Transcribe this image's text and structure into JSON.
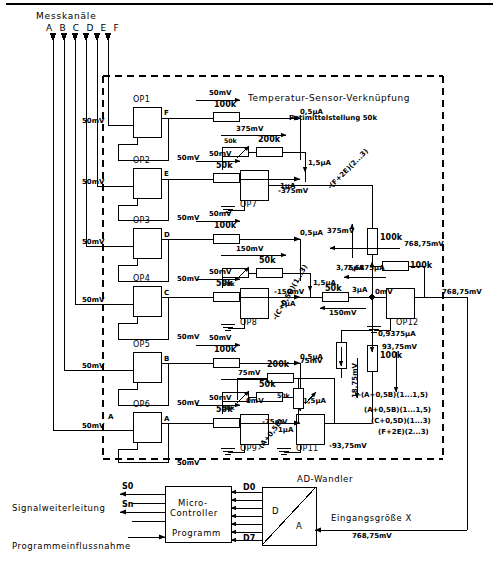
{
  "meta": {
    "width": 499,
    "height": 587,
    "ink": "#000000",
    "background": "#ffffff"
  },
  "inputs": {
    "header": "Messkanäle",
    "channels": "A B C D E F",
    "channel_list": [
      "A",
      "B",
      "C",
      "D",
      "E",
      "F"
    ],
    "input_voltage": "50mV"
  },
  "diagram_title": "Temperatur-Sensor-Verknüpfung",
  "pot_note": "Potimittelstellung 50k",
  "stages": [
    {
      "opamp": "OP1",
      "out_letter": "F",
      "fb": "50mV",
      "in": "50mV",
      "arrow_v": "50mV",
      "resistor": "100k",
      "current": "0,5µA"
    },
    {
      "opamp": "OP2",
      "out_letter": "E",
      "fb": "50mV",
      "in": "50mV",
      "arrow_v": "50mV",
      "resistor": "50k",
      "current": "1µA"
    },
    {
      "opamp": "OP3",
      "out_letter": "D",
      "fb": "50mV",
      "in": "50mV",
      "arrow_v": "50mV",
      "resistor": "100k",
      "current": "0,5µA"
    },
    {
      "opamp": "OP4",
      "out_letter": "C",
      "fb": "50mV",
      "in": "50mV",
      "arrow_v": "50mV",
      "resistor": "50k",
      "current": "1µA"
    },
    {
      "opamp": "OP5",
      "out_letter": "B",
      "fb": "50mV",
      "in": "50mV",
      "arrow_v": "50mV",
      "resistor": "100k",
      "current": "0,5µA"
    },
    {
      "opamp": "OP6",
      "out_letter": "A",
      "fb": "50mV",
      "in": "50mV",
      "arrow_v": "50mV",
      "resistor": "50k",
      "current": "1µA"
    }
  ],
  "summers": [
    {
      "opamp": "OP7",
      "pot": "50k",
      "series_r": "200k",
      "arrow_v": "375mV",
      "current": "1,5µA",
      "out_v": "-375mV",
      "formula": "-(F+2E)(2...3)"
    },
    {
      "opamp": "OP8",
      "pot": "50k",
      "series_r": "50k",
      "arrow_v": "150mV",
      "current": "1,5µA",
      "out_v": "-150mV",
      "formula": "-(C+0,5D)(1...3)"
    },
    {
      "opamp": "OP9",
      "pot": "50k",
      "series_r": "50k",
      "arrow_v": "75mV",
      "current": "1,5µA",
      "out_v": "-75mV",
      "formula": "-(A+0,5B)",
      "zero": "0mV"
    }
  ],
  "op11": {
    "opamp": "OP11",
    "in_v": "-75mV",
    "series_r": "200k",
    "pot": "50k",
    "top_v": "75mV",
    "rot_v": "18,75mV",
    "out_v": "-93,75mV",
    "right_v": "93,75mV",
    "r_100k": "100k",
    "current": "0,9375µA"
  },
  "op12": {
    "opamp": "OP12",
    "zero": "0mV",
    "feedback_r": "100k",
    "feedback_v": "768,75mV",
    "feedback_i": "7,6875µA",
    "up_r": "100k",
    "up_v": "375mV",
    "up_i": "3,75µA",
    "out_v": "768,75mV",
    "node_i": "3µA",
    "node_r": "50k",
    "node_v": "150mV"
  },
  "formula_block": [
    "(A+0,5B)(1...1,5)",
    "(C+0,5D)(1...3)",
    "(F+2E)(2...3)"
  ],
  "formula_left": "-(A+0,5B)(1...1,5)",
  "adc": {
    "title": "AD-Wandler",
    "d_label": "D",
    "a_label": "A",
    "bus_top": "D0",
    "bus_bottom": "D7",
    "input_label": "Eingangsgröße X",
    "input_value": "768,75mV"
  },
  "mcu": {
    "line1": "Micro-",
    "line2": "Controller",
    "program": "Programm",
    "out_top": "S0",
    "out_bottom": "Sn",
    "note_signal": "Signalweiterleitung",
    "note_program": "Programmeinflussnahme"
  }
}
